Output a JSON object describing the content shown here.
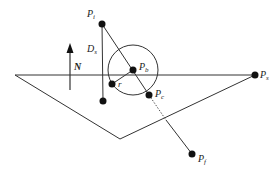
{
  "diagram": {
    "colors": {
      "stroke": "#333333",
      "point": "#111111",
      "background": "#ffffff"
    },
    "points": {
      "Pi": {
        "label": "P",
        "sub": "i",
        "x": 102,
        "y": 24
      },
      "Pb": {
        "label": "P",
        "sub": "b",
        "x": 133,
        "y": 70
      },
      "Pc": {
        "label": "P",
        "sub": "c",
        "x": 149,
        "y": 95
      },
      "Ps": {
        "label": "P",
        "sub": "s",
        "x": 255,
        "y": 75
      },
      "Pf": {
        "label": "P",
        "sub": "f",
        "x": 192,
        "y": 154
      },
      "Pr": {
        "x": 112,
        "y": 84
      },
      "Pd": {
        "x": 103,
        "y": 101
      }
    },
    "labels": {
      "normal": "N",
      "distance": "D",
      "distance_sub": "s",
      "radius": "r"
    },
    "circle": {
      "cx": 133,
      "cy": 70,
      "r": 25
    },
    "triangle": [
      [
        15,
        75
      ],
      [
        120,
        139
      ],
      [
        255,
        75
      ]
    ]
  }
}
